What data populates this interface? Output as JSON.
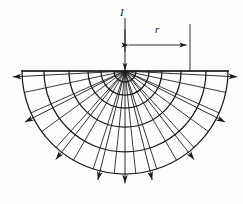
{
  "figure": {
    "type": "technical-diagram",
    "background_color": "#fdfdfd",
    "line_color": "#1a1a1a",
    "labels": {
      "current": "I",
      "radius": "r"
    },
    "geometry": {
      "center_x": 125,
      "surface_y": 71,
      "surface_line_x1": 22,
      "surface_line_x2": 228,
      "arc_radii": [
        11,
        24,
        37,
        56,
        81,
        103
      ],
      "flow_line_angles_deg": [
        0,
        12,
        24,
        36,
        48,
        60,
        72,
        84,
        90,
        96,
        108,
        120,
        132,
        144,
        156,
        168,
        180
      ],
      "arrow_line_angles_deg": [
        3,
        27,
        52,
        76,
        90,
        104,
        128,
        153,
        177
      ],
      "arrow_tip_radius": 112,
      "dimension_line_y": 45,
      "dimension_x1": 125,
      "dimension_x2": 190,
      "current_arrow_x": 125,
      "current_arrow_y1": 18,
      "current_arrow_y2": 70
    }
  }
}
